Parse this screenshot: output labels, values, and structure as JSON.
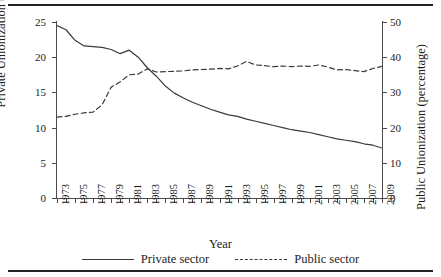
{
  "chart_data": {
    "type": "line",
    "title": "",
    "xlabel": "Year",
    "ylabel": "Private Unionization (percentage)",
    "ylabel_right": "Public Unionization (percentage)",
    "xlim": [
      1973,
      2009
    ],
    "ylim": [
      0,
      25
    ],
    "ylim_right": [
      0,
      50
    ],
    "yticks": [
      0,
      5,
      10,
      15,
      20,
      25
    ],
    "yticks_right": [
      0,
      10,
      20,
      30,
      40,
      50
    ],
    "xticks": [
      1973,
      1975,
      1977,
      1979,
      1981,
      1983,
      1985,
      1987,
      1989,
      1991,
      1993,
      1995,
      1997,
      1999,
      2001,
      2003,
      2005,
      2007,
      2009
    ],
    "x": [
      1973,
      1974,
      1975,
      1976,
      1977,
      1978,
      1979,
      1980,
      1981,
      1982,
      1983,
      1984,
      1985,
      1986,
      1987,
      1988,
      1989,
      1990,
      1991,
      1992,
      1993,
      1994,
      1995,
      1996,
      1997,
      1998,
      1999,
      2000,
      2001,
      2002,
      2003,
      2004,
      2005,
      2006,
      2007,
      2008,
      2009
    ],
    "grid": false,
    "legend_position": "bottom",
    "series": [
      {
        "name": "Private sector",
        "axis": "left",
        "style": "solid",
        "color": "#3a3a3a",
        "values": [
          24.5,
          23.9,
          22.4,
          21.6,
          21.5,
          21.4,
          21.1,
          20.5,
          21.0,
          20.0,
          18.5,
          17.3,
          15.9,
          14.9,
          14.2,
          13.6,
          13.1,
          12.6,
          12.2,
          11.8,
          11.6,
          11.2,
          10.9,
          10.6,
          10.3,
          10.0,
          9.7,
          9.5,
          9.3,
          9.0,
          8.7,
          8.4,
          8.2,
          8.0,
          7.7,
          7.5,
          7.1
        ]
      },
      {
        "name": "Public sector",
        "axis": "right",
        "style": "dashed",
        "color": "#3a3a3a",
        "values": [
          23.0,
          23.2,
          23.8,
          24.2,
          24.4,
          26.5,
          31.5,
          33.0,
          35.0,
          35.2,
          36.7,
          35.8,
          35.9,
          36.0,
          36.1,
          36.4,
          36.5,
          36.6,
          36.8,
          36.7,
          37.5,
          38.8,
          37.8,
          37.6,
          37.3,
          37.5,
          37.3,
          37.5,
          37.4,
          37.8,
          37.2,
          36.4,
          36.5,
          36.2,
          35.9,
          36.8,
          37.4
        ]
      }
    ]
  },
  "legend": {
    "items": [
      {
        "label": "Private sector"
      },
      {
        "label": "Public sector"
      }
    ]
  },
  "axes": {
    "left_title": "Private Unionization (percentage)",
    "right_title": "Public Unionization (percentage)",
    "x_title": "Year"
  }
}
